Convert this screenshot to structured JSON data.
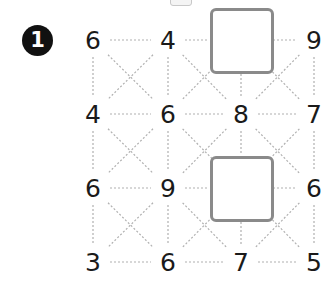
{
  "puzzle": {
    "number_badge": "1",
    "colors": {
      "badge_bg": "#111111",
      "badge_text": "#ffffff",
      "number_text": "#1a1a1a",
      "box_border": "#8a8a8a",
      "line": "#b0b0b0"
    },
    "grid": {
      "columns_x": [
        93,
        168,
        241,
        314
      ],
      "rows_y": [
        40,
        114,
        188,
        262
      ],
      "cells": [
        [
          "6",
          "4",
          "",
          "9"
        ],
        [
          "4",
          "6",
          "8",
          "7"
        ],
        [
          "6",
          "9",
          "",
          "6"
        ],
        [
          "3",
          "6",
          "7",
          "5"
        ]
      ],
      "empty_boxes": [
        {
          "row": 0,
          "col": 2
        },
        {
          "row": 2,
          "col": 2
        }
      ]
    }
  }
}
